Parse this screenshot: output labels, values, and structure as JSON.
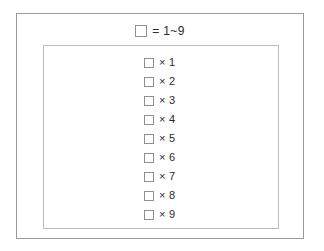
{
  "frame": {
    "name": "worksheet-frame"
  },
  "legend": {
    "box_icon": "empty-square-icon",
    "text": "= 1~9"
  },
  "list": {
    "items": [
      {
        "box_icon": "empty-square-icon",
        "label": "× 1"
      },
      {
        "box_icon": "empty-square-icon",
        "label": "× 2"
      },
      {
        "box_icon": "empty-square-icon",
        "label": "× 3"
      },
      {
        "box_icon": "empty-square-icon",
        "label": "× 4"
      },
      {
        "box_icon": "empty-square-icon",
        "label": "× 5"
      },
      {
        "box_icon": "empty-square-icon",
        "label": "× 6"
      },
      {
        "box_icon": "empty-square-icon",
        "label": "× 7"
      },
      {
        "box_icon": "empty-square-icon",
        "label": "× 8"
      },
      {
        "box_icon": "empty-square-icon",
        "label": "× 9"
      }
    ]
  },
  "colors": {
    "background": "#ffffff",
    "outer_border": "#9a9a9a",
    "inner_border": "#bcbcbc",
    "box_border": "#8f8f8f",
    "text": "#2b2b2b"
  }
}
